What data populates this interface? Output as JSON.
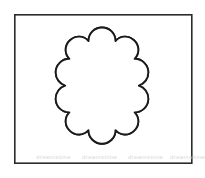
{
  "page": {
    "width": 205,
    "height": 178,
    "background_color": "#ffffff"
  },
  "frame": {
    "name": "outer-border-rectangle",
    "x": 14,
    "y": 14,
    "width": 178,
    "height": 150,
    "stroke_color": "#2b2b2b",
    "stroke_width": 1.6,
    "fill_color": "#ffffff"
  },
  "figure": {
    "name": "scalloped-flower-outline",
    "center_x": 102,
    "center_y": 87,
    "left_extent": 55,
    "right_extent": 150,
    "top_extent": 27,
    "bottom_extent": 147,
    "stroke_color": "#1a1a1a",
    "stroke_width": 1.8,
    "fill_color": "#ffffff"
  },
  "lattice": {
    "name": "diagonal-trellis-pattern",
    "description": "Criss-crossing 45 degree double-outlined bands forming a diamond lattice inside the scalloped shape",
    "band_width": 3.6,
    "band_spacing": 17.5,
    "band_fill_color": "#ffffff",
    "band_stroke_color": "#3a3a3a",
    "band_stroke_width": 0.75,
    "direction_a_degrees": 45,
    "direction_b_degrees": -45,
    "count_direction_a": 9,
    "count_direction_b": 9
  },
  "watermark": {
    "name": "faint-watermark-text",
    "text": "dreamstime",
    "color": "#dcdcdc",
    "y": 159,
    "repeat_x": [
      36,
      82,
      128,
      170
    ]
  }
}
